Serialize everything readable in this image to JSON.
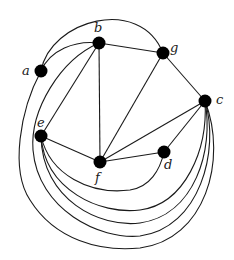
{
  "diagram": {
    "type": "graph",
    "nodes": [
      {
        "id": "a",
        "label": "a",
        "x": 41,
        "y": 71,
        "lx": 22,
        "ly": 75
      },
      {
        "id": "b",
        "label": "b",
        "x": 99,
        "y": 43,
        "lx": 94,
        "ly": 32
      },
      {
        "id": "g",
        "label": "g",
        "x": 163,
        "y": 53,
        "lx": 170,
        "ly": 52
      },
      {
        "id": "c",
        "label": "c",
        "x": 205,
        "y": 101,
        "lx": 216,
        "ly": 104
      },
      {
        "id": "e",
        "label": "e",
        "x": 41,
        "y": 136,
        "lx": 37,
        "ly": 127
      },
      {
        "id": "f",
        "label": "f",
        "x": 100,
        "y": 162,
        "lx": 95,
        "ly": 182
      },
      {
        "id": "d",
        "label": "d",
        "x": 164,
        "y": 152,
        "lx": 164,
        "ly": 169
      }
    ],
    "edges": [
      {
        "id": "a-g",
        "from": "a",
        "to": "g",
        "path": "M41,71 C50,20 140,-5 163,53"
      },
      {
        "id": "a-b",
        "from": "a",
        "to": "b",
        "path": "M41,71 C50,50 75,40 99,43"
      },
      {
        "id": "b-g",
        "from": "b",
        "to": "g",
        "path": "M99,43 L163,53"
      },
      {
        "id": "b-e",
        "from": "b",
        "to": "e",
        "path": "M99,43 L41,136"
      },
      {
        "id": "b-f",
        "from": "b",
        "to": "f",
        "path": "M99,43 L100,162"
      },
      {
        "id": "g-f",
        "from": "g",
        "to": "f",
        "path": "M163,53 L100,162"
      },
      {
        "id": "g-c",
        "from": "g",
        "to": "c",
        "path": "M163,53 L205,101"
      },
      {
        "id": "e-f",
        "from": "e",
        "to": "f",
        "path": "M41,136 L100,162"
      },
      {
        "id": "f-c",
        "from": "f",
        "to": "c",
        "path": "M100,162 L205,101"
      },
      {
        "id": "f-d",
        "from": "f",
        "to": "d",
        "path": "M100,162 L164,152"
      },
      {
        "id": "d-c",
        "from": "d",
        "to": "c",
        "path": "M164,152 L205,101"
      },
      {
        "id": "e-d",
        "from": "e",
        "to": "d",
        "path": "M41,136 C50,175 90,195 130,190 C150,187 160,170 164,152"
      },
      {
        "id": "e-c-1",
        "from": "e",
        "to": "c",
        "path": "M41,136 C45,190 100,215 140,210 C185,204 208,150 205,101"
      },
      {
        "id": "e-c-2",
        "from": "e",
        "to": "c",
        "path": "M41,136 C42,200 100,228 140,223 C195,215 214,150 205,101"
      },
      {
        "id": "b-c",
        "from": "b",
        "to": "c",
        "path": "M99,43 C60,60 30,110 33,150 C38,210 100,240 140,236 C200,228 220,150 205,101"
      },
      {
        "id": "a-c",
        "from": "a",
        "to": "c",
        "path": "M41,71 C20,110 10,170 30,200 C55,240 100,252 140,248 C205,240 228,160 205,101"
      }
    ]
  }
}
